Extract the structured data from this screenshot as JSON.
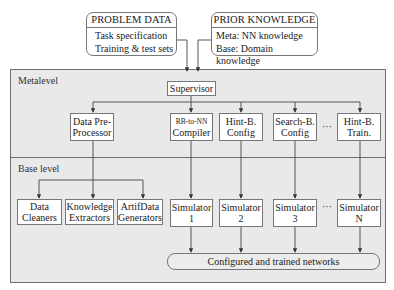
{
  "inputs": {
    "problem_data": {
      "title": "PROBLEM DATA",
      "lines": [
        "Task specification",
        "Training & test sets"
      ]
    },
    "prior_knowledge": {
      "title": "PRIOR KNOWLEDGE",
      "lines": [
        "Meta: NN knowledge",
        "Base: Domain knowledge"
      ]
    }
  },
  "levels": {
    "meta": "Metalevel",
    "base": "Base level"
  },
  "supervisor": "Supervisor",
  "meta_modules": [
    {
      "line1": "Data Pre-",
      "line2": "Processor"
    },
    {
      "line1": "RB-to-NN",
      "line2": "Compiler"
    },
    {
      "line1": "Hint-B.",
      "line2": "Config"
    },
    {
      "line1": "Search-B.",
      "line2": "Config"
    },
    {
      "line1": "Hint-B.",
      "line2": "Train."
    }
  ],
  "base_modules": [
    {
      "line1": "Data",
      "line2": "Cleaners"
    },
    {
      "line1": "Knowledge",
      "line2": "Extractors"
    },
    {
      "line1": "ArtifData",
      "line2": "Generators"
    }
  ],
  "simulators": [
    {
      "line1": "Simulator",
      "line2": "1"
    },
    {
      "line1": "Simulator",
      "line2": "2"
    },
    {
      "line1": "Simulator",
      "line2": "3"
    },
    {
      "line1": "Simulator",
      "line2": "N"
    }
  ],
  "ellipsis": "···",
  "output": "Configured and trained networks"
}
